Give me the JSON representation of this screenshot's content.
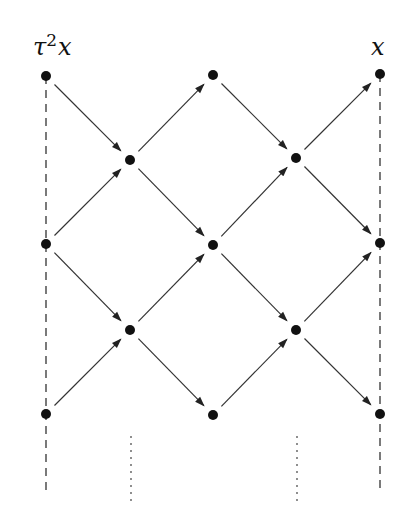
{
  "diagram": {
    "type": "auslander-reiten-quiver-mesh",
    "labels": {
      "left_top": {
        "base": "τ",
        "sup": "2",
        "tail": "x"
      },
      "right_top": "x"
    },
    "nodes": [
      {
        "id": "a1",
        "x": 46,
        "y": 76
      },
      {
        "id": "a2",
        "x": 46,
        "y": 244
      },
      {
        "id": "a3",
        "x": 46,
        "y": 414
      },
      {
        "id": "b1",
        "x": 130,
        "y": 160
      },
      {
        "id": "b2",
        "x": 130,
        "y": 330
      },
      {
        "id": "c1",
        "x": 213,
        "y": 75
      },
      {
        "id": "c2",
        "x": 213,
        "y": 245
      },
      {
        "id": "c3",
        "x": 213,
        "y": 415
      },
      {
        "id": "d1",
        "x": 296,
        "y": 158
      },
      {
        "id": "d2",
        "x": 296,
        "y": 330
      },
      {
        "id": "e1",
        "x": 380,
        "y": 74
      },
      {
        "id": "e2",
        "x": 380,
        "y": 243
      },
      {
        "id": "e3",
        "x": 380,
        "y": 414
      }
    ],
    "arrows": [
      [
        "a1",
        "b1"
      ],
      [
        "a2",
        "b1"
      ],
      [
        "a2",
        "b2"
      ],
      [
        "a3",
        "b2"
      ],
      [
        "b1",
        "c1"
      ],
      [
        "b1",
        "c2"
      ],
      [
        "b2",
        "c2"
      ],
      [
        "b2",
        "c3"
      ],
      [
        "c1",
        "d1"
      ],
      [
        "c2",
        "d1"
      ],
      [
        "c2",
        "d2"
      ],
      [
        "c3",
        "d2"
      ],
      [
        "d1",
        "e1"
      ],
      [
        "d1",
        "e2"
      ],
      [
        "d2",
        "e2"
      ],
      [
        "d2",
        "e3"
      ]
    ],
    "dashed_lines": [
      {
        "x": 46,
        "y1": 76,
        "y2": 492
      },
      {
        "x": 380,
        "y1": 74,
        "y2": 492
      }
    ],
    "dotted_lines": [
      {
        "x": 131,
        "y1": 436,
        "y2": 502
      },
      {
        "x": 297,
        "y1": 436,
        "y2": 502
      }
    ],
    "colors": {
      "ink": "#111111",
      "line": "#333333",
      "background": "#ffffff"
    }
  }
}
